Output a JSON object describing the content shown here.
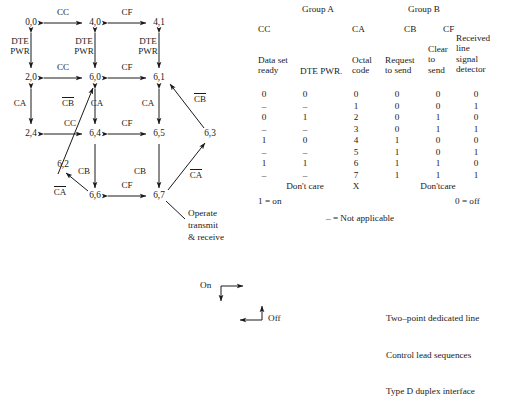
{
  "diagram": {
    "title_caption": {
      "line1": "Two–point dedicated line",
      "line2": "Control lead sequences",
      "line3": "Type D duplex interface"
    },
    "nodes": [
      {
        "id": "n00",
        "label": "0,0",
        "x": 31,
        "y": 23
      },
      {
        "id": "n40",
        "label": "4,0",
        "x": 95,
        "y": 23
      },
      {
        "id": "n41",
        "label": "4,1",
        "x": 159,
        "y": 23
      },
      {
        "id": "n20",
        "label": "2,0",
        "x": 31,
        "y": 78
      },
      {
        "id": "n60",
        "label": "6,0",
        "x": 95,
        "y": 78
      },
      {
        "id": "n61",
        "label": "6,1",
        "x": 159,
        "y": 78
      },
      {
        "id": "n24",
        "label": "2,4",
        "x": 31,
        "y": 134
      },
      {
        "id": "n64",
        "label": "6,4",
        "x": 95,
        "y": 134
      },
      {
        "id": "n65",
        "label": "6,5",
        "x": 159,
        "y": 134
      },
      {
        "id": "n63",
        "label": "6,3",
        "x": 210,
        "y": 134
      },
      {
        "id": "n62",
        "label": "6,2",
        "x": 63,
        "y": 165
      },
      {
        "id": "n66",
        "label": "6,6",
        "x": 95,
        "y": 196
      },
      {
        "id": "n67",
        "label": "6,7",
        "x": 159,
        "y": 196
      }
    ],
    "edge_labels": [
      {
        "id": "e_cc_top",
        "text": "CC",
        "overline": false,
        "x": 63,
        "y": 13
      },
      {
        "id": "e_cf_top",
        "text": "CF",
        "overline": false,
        "x": 127,
        "y": 13
      },
      {
        "id": "e_cc_mid",
        "text": "CC",
        "overline": false,
        "x": 63,
        "y": 68
      },
      {
        "id": "e_cf_mid",
        "text": "CF",
        "overline": false,
        "x": 127,
        "y": 68
      },
      {
        "id": "e_cc_low",
        "text": "CC",
        "overline": false,
        "x": 70,
        "y": 124
      },
      {
        "id": "e_cf_low",
        "text": "CF",
        "overline": false,
        "x": 127,
        "y": 124
      },
      {
        "id": "e_cf_bot",
        "text": "CF",
        "overline": false,
        "x": 127,
        "y": 186
      },
      {
        "id": "e_dte_1",
        "text": "DTE\nPWR",
        "overline": false,
        "x": 20,
        "y": 42
      },
      {
        "id": "e_dte_2",
        "text": "DTE\nPWR",
        "overline": false,
        "x": 84,
        "y": 42
      },
      {
        "id": "e_dte_3",
        "text": "DTE\nPWR",
        "overline": false,
        "x": 148,
        "y": 42
      },
      {
        "id": "e_ca_left",
        "text": "CA",
        "overline": false,
        "x": 20,
        "y": 104
      },
      {
        "id": "e_ca_mid",
        "text": "CA",
        "overline": false,
        "x": 97,
        "y": 104
      },
      {
        "id": "e_ca_right",
        "text": "CA",
        "overline": false,
        "x": 148,
        "y": 104
      },
      {
        "id": "e_cbbar_diag",
        "text": "CB",
        "overline": true,
        "x": 68,
        "y": 104
      },
      {
        "id": "e_cb_1",
        "text": "CB",
        "overline": false,
        "x": 84,
        "y": 172
      },
      {
        "id": "e_cb_2",
        "text": "CB",
        "overline": false,
        "x": 140,
        "y": 172
      },
      {
        "id": "e_cbbar_right",
        "text": "CB",
        "overline": true,
        "x": 200,
        "y": 100
      },
      {
        "id": "e_cabar_right",
        "text": "CA",
        "overline": true,
        "x": 196,
        "y": 176
      },
      {
        "id": "e_cabar_left",
        "text": "CA",
        "overline": true,
        "x": 60,
        "y": 193
      }
    ],
    "annotation": {
      "id": "operate-note",
      "line1": "Operate",
      "line2": "transmit",
      "line3": "& receive",
      "x": 188,
      "y": 208
    },
    "legend": {
      "on_label": "On",
      "off_label": "Off"
    }
  },
  "table": {
    "groups": [
      {
        "label": "Group A",
        "x": 302,
        "y": 4
      },
      {
        "label": "Group B",
        "x": 408,
        "y": 4
      }
    ],
    "signal_codes": [
      {
        "code": "CC",
        "x": 258,
        "y": 24
      },
      {
        "code": "CA",
        "x": 352,
        "y": 24
      },
      {
        "code": "CB",
        "x": 404,
        "y": 24
      },
      {
        "code": "CF",
        "x": 443,
        "y": 24
      }
    ],
    "headers": [
      {
        "id": "h-data-set-ready",
        "lines": [
          "Data set",
          "ready"
        ],
        "x": 258,
        "y": 55
      },
      {
        "id": "h-dte-pwr",
        "lines": [
          "DTE PWR."
        ],
        "x": 300,
        "y": 66
      },
      {
        "id": "h-octal-code",
        "lines": [
          "Octal",
          "code"
        ],
        "x": 352,
        "y": 55
      },
      {
        "id": "h-request-to-send",
        "lines": [
          "Request",
          "to send"
        ],
        "x": 385,
        "y": 55
      },
      {
        "id": "h-clear-to-send",
        "lines": [
          "Clear",
          "to",
          "send"
        ],
        "x": 428,
        "y": 44
      },
      {
        "id": "h-received-line",
        "lines": [
          "Received",
          "line",
          "signal",
          "detector"
        ],
        "x": 456,
        "y": 33
      }
    ],
    "columns_x": [
      264,
      305,
      356,
      397,
      438,
      476
    ],
    "rows": [
      [
        "0",
        "0",
        "0",
        "0",
        "0",
        "0"
      ],
      [
        "–",
        "–",
        "1",
        "0",
        "0",
        "1"
      ],
      [
        "0",
        "1",
        "2",
        "0",
        "1",
        "0"
      ],
      [
        "–",
        "–",
        "3",
        "0",
        "1",
        "1"
      ],
      [
        "1",
        "0",
        "4",
        "1",
        "0",
        "0"
      ],
      [
        "–",
        "–",
        "5",
        "1",
        "0",
        "1"
      ],
      [
        "1",
        "1",
        "6",
        "1",
        "1",
        "0"
      ],
      [
        "–",
        "–",
        "7",
        "1",
        "1",
        "1"
      ]
    ],
    "row_y_start": 89,
    "row_step": 11.5,
    "footers": [
      {
        "id": "dont-care-a",
        "text": "Don't care",
        "x": 305,
        "y": 181
      },
      {
        "id": "dont-care-octal",
        "text": "X",
        "x": 356,
        "y": 181
      },
      {
        "id": "dont-care-b",
        "text": "Don'tcare",
        "x": 438,
        "y": 181
      }
    ],
    "notes": [
      {
        "id": "note-on",
        "text": "1 = on",
        "x": 258,
        "y": 196
      },
      {
        "id": "note-off",
        "text": "0 = off",
        "x": 455,
        "y": 196
      },
      {
        "id": "note-na",
        "text": "– = Not applicable",
        "x": 326,
        "y": 213
      }
    ]
  }
}
